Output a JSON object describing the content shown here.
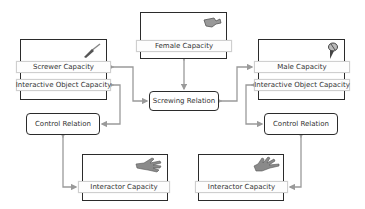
{
  "diagram": {
    "female": {
      "label": "Female Capacity",
      "icon": "screw-head-icon"
    },
    "screwer": {
      "labels": [
        "Screwer Capacity",
        "Interactive Object Capacity"
      ],
      "icon": "screwdriver-icon"
    },
    "male": {
      "labels": [
        "Male Capacity",
        "Interactive Object Capacity"
      ],
      "icon": "screw-icon"
    },
    "screwing_relation": {
      "label": "Screwing Relation"
    },
    "control_left": {
      "label": "Control Relation"
    },
    "control_right": {
      "label": "Control Relation"
    },
    "interactor_left": {
      "label": "Interactor Capacity",
      "icon": "hand-icon"
    },
    "interactor_right": {
      "label": "Interactor Capacity",
      "icon": "hand-icon"
    },
    "colors": {
      "frame": "#2b2b2b",
      "connector": "#9a9a9a",
      "text": "#333333"
    }
  }
}
